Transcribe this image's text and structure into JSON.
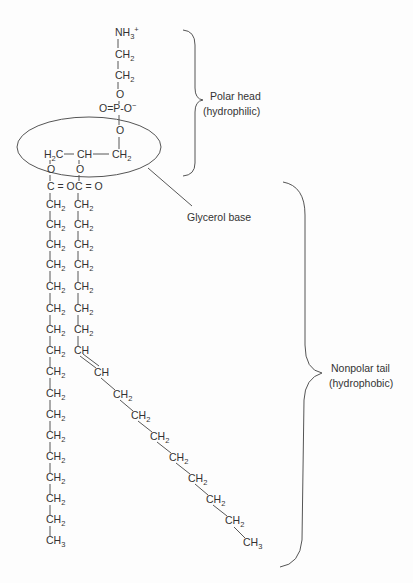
{
  "diagram": {
    "colors": {
      "text": "#333333",
      "line": "#555555",
      "background": "#fdfdfd"
    },
    "head_group": {
      "atoms": [
        {
          "id": "nh3",
          "main": "NH",
          "sub": "3",
          "sup": "+",
          "x": 115,
          "y": 36
        },
        {
          "id": "ch2a",
          "main": "CH",
          "sub": "2",
          "x": 115,
          "y": 58
        },
        {
          "id": "ch2b",
          "main": "CH",
          "sub": "2",
          "x": 115,
          "y": 79
        },
        {
          "id": "o1",
          "main": "O",
          "x": 116,
          "y": 98
        },
        {
          "id": "phosphate",
          "main": "O=P-O",
          "sup": "−",
          "x": 99,
          "y": 112
        },
        {
          "id": "o2",
          "main": "O",
          "x": 116,
          "y": 134
        }
      ]
    },
    "glycerol": {
      "atoms": [
        {
          "id": "c1",
          "pre": "H",
          "pre_sub": "2",
          "main": "C",
          "x": 44,
          "y": 158
        },
        {
          "id": "c2",
          "main": "CH",
          "x": 77,
          "y": 158
        },
        {
          "id": "c3",
          "main": "CH",
          "sub": "2",
          "x": 112,
          "y": 158
        },
        {
          "id": "o_left",
          "main": "O",
          "x": 47,
          "y": 173
        },
        {
          "id": "o_right",
          "main": "O",
          "x": 76,
          "y": 173
        },
        {
          "id": "co_left",
          "main": "C = O",
          "x": 47,
          "y": 190
        },
        {
          "id": "co_right",
          "main": "C = O",
          "x": 75,
          "y": 190
        }
      ]
    },
    "left_tail": {
      "x": 46,
      "ch2_rows_y": [
        208,
        228,
        248,
        268,
        290,
        312,
        333,
        354,
        375,
        397,
        418,
        439,
        460,
        481,
        502,
        523
      ],
      "ch2_label": "CH",
      "ch2_sub": "2",
      "terminal": {
        "main": "CH",
        "sub": "3",
        "y": 544
      }
    },
    "right_tail": {
      "x": 74,
      "ch2_rows_y": [
        208,
        228,
        248,
        268,
        290,
        312,
        333
      ],
      "ch2_label": "CH",
      "ch2_sub": "2",
      "double_bond": [
        {
          "main": "CH",
          "x": 74,
          "y": 354
        },
        {
          "main": "CH",
          "x": 94,
          "y": 376
        }
      ],
      "diagonal": [
        {
          "main": "CH",
          "sub": "2",
          "x": 113,
          "y": 398
        },
        {
          "main": "CH",
          "sub": "2",
          "x": 131,
          "y": 419
        },
        {
          "main": "CH",
          "sub": "2",
          "x": 150,
          "y": 440
        },
        {
          "main": "CH",
          "sub": "2",
          "x": 169,
          "y": 461
        },
        {
          "main": "CH",
          "sub": "2",
          "x": 188,
          "y": 482
        },
        {
          "main": "CH",
          "sub": "2",
          "x": 206,
          "y": 503
        },
        {
          "main": "CH",
          "sub": "2",
          "x": 225,
          "y": 524
        }
      ],
      "terminal": {
        "main": "CH",
        "sub": "3",
        "x": 243,
        "y": 546
      }
    },
    "annotations": {
      "polar_head": {
        "line1": "Polar head",
        "line2": "(hydrophilic)"
      },
      "glycerol_base": {
        "label": "Glycerol base"
      },
      "nonpolar_tail": {
        "line1": "Nonpolar tail",
        "line2": "(hydrophobic)"
      }
    }
  }
}
